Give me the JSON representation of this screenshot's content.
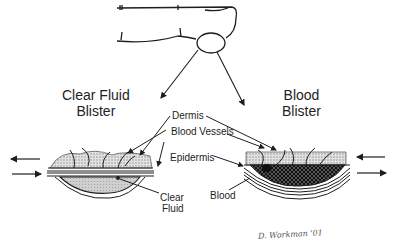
{
  "diagram": {
    "left_title": {
      "line1": "Clear Fluid",
      "line2": "Blister"
    },
    "right_title": {
      "line1": "Blood",
      "line2": "Blister"
    },
    "labels": {
      "dermis": "Dermis",
      "blood_vessels": "Blood Vessels",
      "epidermis": "Epidermis",
      "clear_fluid_1": "Clear",
      "clear_fluid_2": "Fluid",
      "blood": "Blood"
    },
    "signature": "D. Workman '01",
    "icons": {
      "finger": "finger-outline-icon",
      "magnifier_circle": "zoom-circle-icon",
      "shear_arrows_left": "shear-force-arrows-icon",
      "shear_arrows_right": "shear-force-arrows-icon"
    },
    "colors": {
      "ink": "#1e1e1e",
      "fluid_fill": "#c8c8c8",
      "blood_fill": "#3a3a3a",
      "dermis_fill": "#d8d8d8"
    }
  }
}
